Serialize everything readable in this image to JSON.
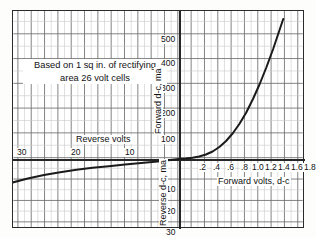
{
  "chart_data": {
    "type": "line",
    "title": "",
    "annotation": "Based on 1 sq in. of rectifying area 26 volt cells",
    "annotation_line1": "Based on 1 sq in. of rectifying",
    "annotation_line2": "area 26 volt cells",
    "grid": true,
    "legend": "none",
    "quadrants": {
      "forward": {
        "xlabel": "Forward volts, d-c",
        "ylabel": "Forward d-c, ma",
        "xticks": [
          ".2",
          ".4",
          ".6",
          ".8",
          "1.0",
          "1.2",
          "1.4",
          "1.6",
          "1.8"
        ],
        "xtick_values": [
          0.2,
          0.4,
          0.6,
          0.8,
          1.0,
          1.2,
          1.4,
          1.6,
          1.8
        ],
        "yticks": [
          "100",
          "200",
          "300",
          "400",
          "500"
        ],
        "ytick_values": [
          100,
          200,
          300,
          400,
          500
        ],
        "xlim": [
          0,
          1.9
        ],
        "ylim": [
          0,
          560
        ]
      },
      "reverse": {
        "xlabel": "Reverse volts",
        "ylabel": "Reverse d-c, ma",
        "xticks": [
          "30",
          "20",
          "10"
        ],
        "xtick_values": [
          30,
          20,
          10
        ],
        "yticks": [
          "10",
          "20",
          "30"
        ],
        "ytick_values": [
          10,
          20,
          30
        ],
        "xlim": [
          34,
          0
        ],
        "ylim": [
          0,
          33
        ]
      }
    },
    "series": [
      {
        "name": "Forward characteristic",
        "xlabel_units": "volts d-c",
        "ylabel_units": "ma",
        "points": [
          [
            0.0,
            0
          ],
          [
            0.1,
            2
          ],
          [
            0.2,
            5
          ],
          [
            0.3,
            10
          ],
          [
            0.4,
            18
          ],
          [
            0.5,
            30
          ],
          [
            0.6,
            48
          ],
          [
            0.7,
            72
          ],
          [
            0.8,
            103
          ],
          [
            0.9,
            141
          ],
          [
            1.0,
            186
          ],
          [
            1.1,
            240
          ],
          [
            1.2,
            300
          ],
          [
            1.3,
            367
          ],
          [
            1.4,
            440
          ],
          [
            1.5,
            520
          ],
          [
            1.55,
            560
          ]
        ]
      },
      {
        "name": "Reverse characteristic",
        "xlabel_units": "reverse volts",
        "ylabel_units": "reverse ma",
        "points": [
          [
            0,
            0.0
          ],
          [
            2,
            0.6
          ],
          [
            4,
            1.1
          ],
          [
            6,
            1.6
          ],
          [
            8,
            2.1
          ],
          [
            10,
            2.6
          ],
          [
            13,
            3.3
          ],
          [
            16,
            4.1
          ],
          [
            19,
            5.0
          ],
          [
            22,
            6.1
          ],
          [
            25,
            7.4
          ],
          [
            28,
            9.0
          ],
          [
            31,
            11.0
          ],
          [
            33,
            12.6
          ]
        ]
      }
    ]
  },
  "colors": {
    "curve": "#1a1a1a",
    "major_grid": "#6d6d6d",
    "minor_grid": "#c9c9c9",
    "axis": "#262626",
    "background": "#ffffff"
  }
}
